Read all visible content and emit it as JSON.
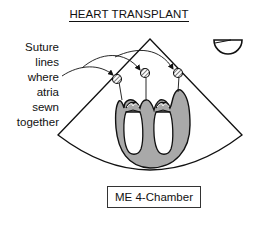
{
  "title": "HEART TRANSPLANT",
  "annotation": {
    "lines": [
      "Suture",
      "lines",
      "where",
      "atria",
      "sewn",
      "together"
    ]
  },
  "view_label": "ME 4-Chamber",
  "icons": {
    "probe_orientation": "half-circle-probe-icon",
    "suture_markers": "hatched-circle-icon"
  },
  "colors": {
    "line": "#111111",
    "myocardium": "#a9a9a9",
    "background": "#ffffff"
  }
}
